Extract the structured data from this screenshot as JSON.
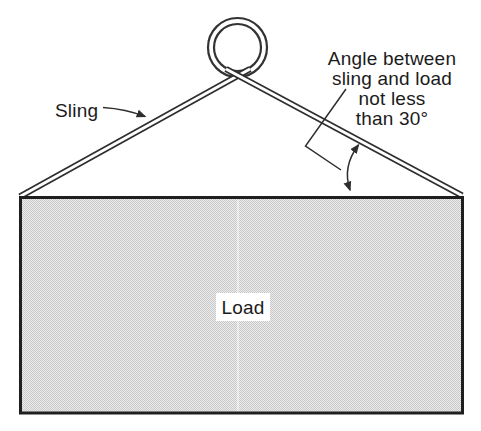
{
  "figure": {
    "sling_label": "Sling",
    "load_label": "Load",
    "angle_note": {
      "line1": "Angle between",
      "line2": "sling and load",
      "line3": "not less",
      "line4": "than 30°"
    },
    "angle_value": "30°",
    "colors": {
      "line": "#2e2e2e",
      "text": "#1b1b1b",
      "background": "#ffffff",
      "load_fill_light": "#ededed",
      "load_fill_dark": "#c7c7c7",
      "load_border": "#1f1f1f"
    }
  }
}
